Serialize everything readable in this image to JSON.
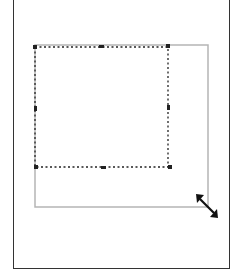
{
  "canvas": {
    "description": "Resize preview of a selected object",
    "colors": {
      "frame": "#333333",
      "selection": "#222222",
      "preview_outline": "#b0b0b0",
      "cursor": "#111111"
    }
  },
  "selection": {
    "handles": 8,
    "style": "dashed"
  },
  "preview": {
    "style": "solid-gray"
  },
  "cursor": {
    "icon": "diagonal-resize-cursor"
  }
}
